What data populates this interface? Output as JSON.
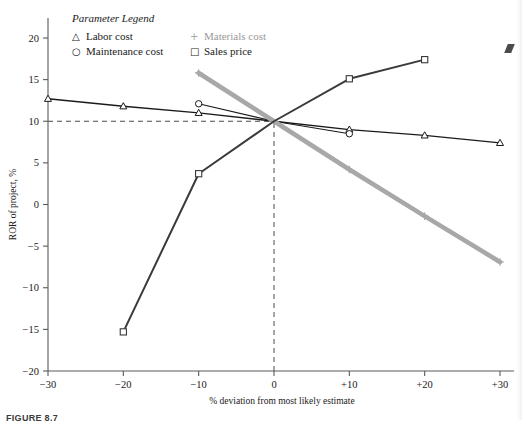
{
  "figure": {
    "caption": "FIGURE 8.7"
  },
  "legend": {
    "title": "Parameter Legend",
    "entries": [
      {
        "glyph": "△",
        "label": "Labor cost",
        "color": "#1a1a1a",
        "muted": false
      },
      {
        "glyph": "○",
        "label": "Maintenance cost",
        "color": "#1a1a1a",
        "muted": false
      },
      {
        "glyph": "+",
        "label": "Materials cost",
        "color": "#a8a8a8",
        "muted": true
      },
      {
        "glyph": "□",
        "label": "Sales price",
        "color": "#1a1a1a",
        "muted": false
      }
    ]
  },
  "chart_data": {
    "type": "line",
    "title": "",
    "xlabel": "% deviation from most likely estimate",
    "ylabel": "ROR of project, %",
    "xlim": [
      -30,
      30
    ],
    "ylim": [
      -20,
      20
    ],
    "xticks": [
      -30,
      -20,
      -10,
      0,
      10,
      20,
      30
    ],
    "xticklabels": [
      "−30",
      "−20",
      "−10",
      "0",
      "+10",
      "+20",
      "+30"
    ],
    "yticks": [
      -20,
      -15,
      -10,
      -5,
      0,
      5,
      10,
      15,
      20
    ],
    "yticklabels": [
      "−20",
      "−15",
      "−10",
      "−5",
      "0",
      "5",
      "10",
      "15",
      "20"
    ],
    "grid": false,
    "legend_position": "top-left-inside",
    "reference_lines": [
      {
        "orientation": "horizontal",
        "value": 10,
        "style": "dashed",
        "from_x": -30,
        "to_x": 0
      },
      {
        "orientation": "vertical",
        "value": 0,
        "style": "dashed",
        "from_y": -20,
        "to_y": 10
      }
    ],
    "series": [
      {
        "name": "Labor cost",
        "marker": "triangle",
        "color": "#1a1a1a",
        "width": 1.4,
        "x": [
          -30,
          -20,
          -10,
          0,
          10,
          20,
          30
        ],
        "y": [
          12.7,
          11.8,
          11.0,
          10.0,
          9.0,
          8.3,
          7.4
        ]
      },
      {
        "name": "Maintenance cost",
        "marker": "circle",
        "color": "#1a1a1a",
        "width": 1.1,
        "x": [
          -10,
          0,
          10
        ],
        "y": [
          12.1,
          10.0,
          8.5
        ]
      },
      {
        "name": "Materials cost",
        "marker": "plus",
        "color": "#a8a8a8",
        "width": 4.6,
        "x": [
          -10,
          0,
          10,
          20,
          30
        ],
        "y": [
          15.8,
          10.0,
          4.2,
          -1.4,
          -6.9
        ]
      },
      {
        "name": "Sales price",
        "marker": "square",
        "color": "#3a3a3a",
        "width": 2.0,
        "x": [
          -20,
          -10,
          0,
          10,
          20
        ],
        "y": [
          -15.3,
          3.7,
          10.0,
          15.1,
          17.4
        ]
      }
    ]
  }
}
